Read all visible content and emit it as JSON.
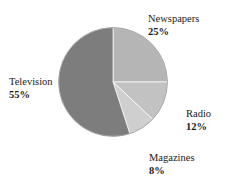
{
  "chart_data": {
    "type": "pie",
    "title": "",
    "title_note": "title is cropped off the top edge of the screenshot and unreadable",
    "categories": [
      "Newspapers",
      "Radio",
      "Magazines",
      "Television"
    ],
    "values": [
      25,
      12,
      8,
      55
    ],
    "value_suffix": "%",
    "start_angle_deg": 0,
    "direction": "clockwise",
    "legend": "none",
    "labels_position": "outside-callout",
    "slices": [
      {
        "name": "Newspapers",
        "value": 25,
        "pct_text": "25%",
        "color": "#b5b5b5"
      },
      {
        "name": "Radio",
        "value": 12,
        "pct_text": "12%",
        "color": "#c2c2c2"
      },
      {
        "name": "Magazines",
        "value": 8,
        "pct_text": "8%",
        "color": "#cfcfcf"
      },
      {
        "name": "Television",
        "value": 55,
        "pct_text": "55%",
        "color": "#7d7d7d"
      }
    ],
    "xlabel": "",
    "ylabel": "",
    "grid": false,
    "total": 100
  },
  "labels": {
    "newspapers": {
      "name": "Newspapers",
      "pct": "25%"
    },
    "radio": {
      "name": "Radio",
      "pct": "12%"
    },
    "magazines": {
      "name": "Magazines",
      "pct": "8%"
    },
    "television": {
      "name": "Television",
      "pct": "55%"
    }
  },
  "colors": {
    "background": "#ffffff",
    "text": "#1a1a1a",
    "outline": "#8a8a8a"
  }
}
